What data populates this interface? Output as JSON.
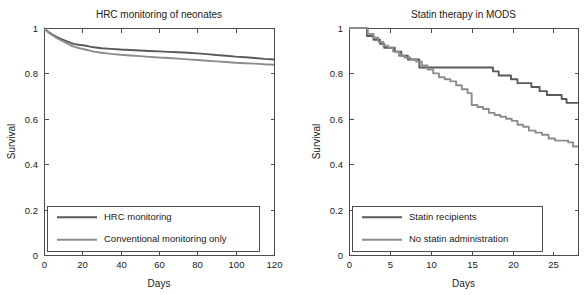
{
  "figure": {
    "background": "#ffffff",
    "axis_color": "#4d4d4d",
    "text_color": "#1a1a1a"
  },
  "chart_data": [
    {
      "id": "hrc-monitoring",
      "type": "line",
      "title": "HRC monitoring of neonates",
      "xlabel": "Days",
      "ylabel": "Survival",
      "xlim": [
        0,
        120
      ],
      "ylim": [
        0,
        1
      ],
      "xticks": [
        0,
        20,
        40,
        60,
        80,
        100,
        120
      ],
      "xticklabels": [
        "0",
        "20",
        "40",
        "60",
        "80",
        "100",
        "120"
      ],
      "yticks": [
        0,
        0.2,
        0.4,
        0.6,
        0.8,
        1
      ],
      "yticklabels": [
        "0",
        "0.2",
        "0.4",
        "0.6",
        "0.8",
        "1"
      ],
      "grid": false,
      "legend_position": "lower-left",
      "series": [
        {
          "name": "HRC monitoring",
          "color": "#595959",
          "x": [
            0,
            2,
            4,
            6,
            8,
            10,
            12,
            14,
            16,
            18,
            20,
            22,
            24,
            26,
            30,
            35,
            40,
            45,
            50,
            55,
            60,
            65,
            70,
            75,
            80,
            85,
            90,
            95,
            100,
            105,
            110,
            115,
            120
          ],
          "y": [
            1.0,
            0.984,
            0.973,
            0.963,
            0.955,
            0.948,
            0.941,
            0.934,
            0.929,
            0.926,
            0.924,
            0.922,
            0.918,
            0.915,
            0.911,
            0.908,
            0.905,
            0.903,
            0.901,
            0.899,
            0.897,
            0.895,
            0.893,
            0.891,
            0.888,
            0.885,
            0.881,
            0.878,
            0.874,
            0.871,
            0.868,
            0.864,
            0.861
          ]
        },
        {
          "name": "Conventional monitoring only",
          "color": "#8c8c8c",
          "x": [
            0,
            2,
            4,
            6,
            8,
            10,
            12,
            14,
            16,
            18,
            20,
            22,
            24,
            26,
            30,
            35,
            40,
            45,
            50,
            55,
            60,
            65,
            70,
            75,
            80,
            85,
            90,
            95,
            100,
            105,
            110,
            115,
            120
          ],
          "y": [
            1.0,
            0.982,
            0.97,
            0.959,
            0.95,
            0.941,
            0.932,
            0.923,
            0.917,
            0.912,
            0.908,
            0.904,
            0.9,
            0.896,
            0.891,
            0.886,
            0.882,
            0.879,
            0.876,
            0.873,
            0.87,
            0.868,
            0.865,
            0.862,
            0.859,
            0.856,
            0.853,
            0.85,
            0.847,
            0.845,
            0.843,
            0.84,
            0.838
          ]
        }
      ]
    },
    {
      "id": "statin-mods",
      "type": "line",
      "title": "Statin therapy in MODS",
      "xlabel": "Days",
      "ylabel": "Survival",
      "xlim": [
        0,
        28
      ],
      "ylim": [
        0,
        1
      ],
      "xticks": [
        0,
        5,
        10,
        15,
        20,
        25
      ],
      "xticklabels": [
        "0",
        "5",
        "10",
        "15",
        "20",
        "25"
      ],
      "yticks": [
        0,
        0.2,
        0.4,
        0.6,
        0.8,
        1
      ],
      "yticklabels": [
        "0",
        "0.2",
        "0.4",
        "0.6",
        "0.8",
        "1"
      ],
      "grid": false,
      "legend_position": "lower-left",
      "series": [
        {
          "name": "Statin recipients",
          "color": "#595959",
          "step": true,
          "x": [
            0,
            1.5,
            2.2,
            3.0,
            3.8,
            4.3,
            4.9,
            5.6,
            6.4,
            7.2,
            8.0,
            8.6,
            17.0,
            17.6,
            18.3,
            19.0,
            19.8,
            20.6,
            21.4,
            22.3,
            23.3,
            24.2,
            25.1,
            26.0,
            26.6,
            28.0
          ],
          "y": [
            1.0,
            1.0,
            0.965,
            0.948,
            0.93,
            0.913,
            0.913,
            0.896,
            0.878,
            0.861,
            0.861,
            0.826,
            0.826,
            0.809,
            0.791,
            0.791,
            0.774,
            0.757,
            0.757,
            0.74,
            0.722,
            0.705,
            0.705,
            0.687,
            0.67,
            0.67
          ]
        },
        {
          "name": "No statin administration",
          "color": "#8c8c8c",
          "step": true,
          "x": [
            0,
            1.6,
            2.3,
            3.0,
            3.6,
            4.2,
            4.8,
            5.4,
            6.1,
            6.8,
            7.5,
            8.2,
            8.9,
            9.6,
            10.3,
            11.0,
            11.7,
            12.4,
            13.1,
            13.8,
            14.5,
            15.0,
            15.7,
            16.4,
            17.1,
            17.8,
            18.5,
            19.2,
            19.9,
            20.6,
            21.3,
            22.0,
            22.8,
            23.6,
            24.4,
            25.2,
            26.0,
            26.8,
            27.4,
            28.0
          ],
          "y": [
            1.0,
            1.0,
            0.974,
            0.957,
            0.939,
            0.922,
            0.913,
            0.896,
            0.878,
            0.87,
            0.861,
            0.852,
            0.835,
            0.817,
            0.8,
            0.783,
            0.774,
            0.765,
            0.748,
            0.73,
            0.713,
            0.661,
            0.652,
            0.643,
            0.626,
            0.617,
            0.609,
            0.6,
            0.591,
            0.574,
            0.565,
            0.548,
            0.539,
            0.53,
            0.513,
            0.504,
            0.504,
            0.496,
            0.478,
            0.478
          ]
        }
      ]
    }
  ]
}
